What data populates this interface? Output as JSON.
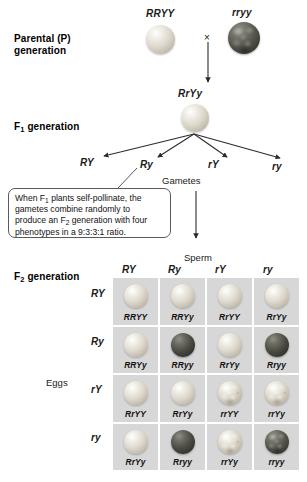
{
  "diagram": {
    "stages": {
      "parental_label": "Parental (P)",
      "parental_label_line2": "generation",
      "f1_label_prefix": "F",
      "f1_label_sub": "1",
      "f1_label_suffix": " generation",
      "f2_label_prefix": "F",
      "f2_label_sub": "2",
      "f2_label_suffix": " generation"
    },
    "parental": {
      "left_genotype": "RRYY",
      "right_genotype": "rryy",
      "cross_symbol": "×",
      "left_phenotype": "round-yellow",
      "right_phenotype": "wrinkled-green"
    },
    "f1": {
      "genotype": "RrYy",
      "phenotype": "round-yellow"
    },
    "gametes": {
      "label": "Gametes",
      "types": [
        "RY",
        "Ry",
        "rY",
        "ry"
      ]
    },
    "callout": {
      "line1_a": "When F",
      "line1_sub": "1",
      "line1_b": " plants self-pollinate, the",
      "line2": "gametes combine randomly to",
      "line3_a": "produce an F",
      "line3_sub": "2",
      "line3_b": " generation with four",
      "line4": "phenotypes in a 9:3:3:1 ratio."
    },
    "punnett": {
      "sperm_label": "Sperm",
      "eggs_label": "Eggs",
      "columns": [
        "RY",
        "Ry",
        "rY",
        "ry"
      ],
      "rows": [
        "RY",
        "Ry",
        "rY",
        "ry"
      ],
      "cells": [
        [
          {
            "genotype": "RRYY",
            "phenotype": "round-yellow"
          },
          {
            "genotype": "RRYy",
            "phenotype": "round-yellow"
          },
          {
            "genotype": "RrYY",
            "phenotype": "round-yellow"
          },
          {
            "genotype": "RrYy",
            "phenotype": "round-yellow"
          }
        ],
        [
          {
            "genotype": "RRYy",
            "phenotype": "round-yellow"
          },
          {
            "genotype": "RRyy",
            "phenotype": "round-green"
          },
          {
            "genotype": "RrYy",
            "phenotype": "round-yellow"
          },
          {
            "genotype": "Rryy",
            "phenotype": "round-green"
          }
        ],
        [
          {
            "genotype": "RrYY",
            "phenotype": "round-yellow"
          },
          {
            "genotype": "RrYy",
            "phenotype": "round-yellow"
          },
          {
            "genotype": "rrYY",
            "phenotype": "wrinkled-yellow"
          },
          {
            "genotype": "rrYy",
            "phenotype": "wrinkled-yellow"
          }
        ],
        [
          {
            "genotype": "RrYy",
            "phenotype": "round-yellow"
          },
          {
            "genotype": "Rryy",
            "phenotype": "round-green"
          },
          {
            "genotype": "rrYy",
            "phenotype": "wrinkled-yellow"
          },
          {
            "genotype": "rryy",
            "phenotype": "wrinkled-green"
          }
        ]
      ],
      "cell_background": "#d7d7d7"
    },
    "colors": {
      "background": "#ffffff",
      "text": "#000000",
      "arrow": "#333333",
      "callout_border": "#5a5a5a"
    }
  }
}
